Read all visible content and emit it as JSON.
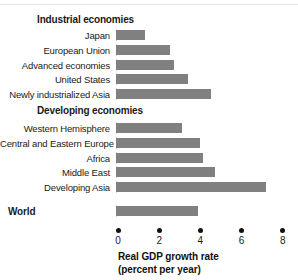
{
  "chart_data": {
    "type": "bar",
    "orientation": "horizontal",
    "title": "",
    "xlabel": "Real GDP growth rate (percent per year)",
    "ylabel": "",
    "xlim": [
      0,
      8
    ],
    "xticks": [
      0,
      2,
      4,
      6,
      8
    ],
    "xtick_labels": [
      "0",
      "2",
      "4",
      "6",
      "8"
    ],
    "grid": false,
    "legend": false,
    "bar_color": "#808080",
    "groups": [
      {
        "name": "Industrial economies",
        "is_heading": true,
        "categories": [
          "Japan",
          "European Union",
          "Advanced economies",
          "United States",
          "Newly industrialized Asia"
        ],
        "values": [
          1.4,
          2.6,
          2.8,
          3.5,
          4.6
        ]
      },
      {
        "name": "Developing economies",
        "is_heading": true,
        "categories": [
          "Western Hemisphere",
          "Central and Eastern Europe",
          "Africa",
          "Middle East",
          "Developing Asia"
        ],
        "values": [
          3.2,
          4.1,
          4.2,
          4.8,
          7.3
        ]
      },
      {
        "name": "World",
        "is_heading": false,
        "categories": [
          "World"
        ],
        "values": [
          4.0
        ]
      }
    ]
  },
  "headings": {
    "industrial": "Industrial economies",
    "developing": "Developing economies",
    "world": "World"
  },
  "rows": [
    {
      "label": "Japan",
      "value": 1.4
    },
    {
      "label": "European Union",
      "value": 2.6
    },
    {
      "label": "Advanced economies",
      "value": 2.8
    },
    {
      "label": "United States",
      "value": 3.5
    },
    {
      "label": "Newly industrialized Asia",
      "value": 4.6
    },
    {
      "label": "Western Hemisphere",
      "value": 3.2
    },
    {
      "label": "Central and Eastern Europe",
      "value": 4.1
    },
    {
      "label": "Africa",
      "value": 4.2
    },
    {
      "label": "Middle East",
      "value": 4.8
    },
    {
      "label": "Developing Asia",
      "value": 7.3
    },
    {
      "label": "World",
      "value": 4.0
    }
  ],
  "axis": {
    "ticks": [
      "0",
      "2",
      "4",
      "6",
      "8"
    ],
    "title_line1": "Real GDP growth rate",
    "title_line2": "(percent per year)"
  }
}
